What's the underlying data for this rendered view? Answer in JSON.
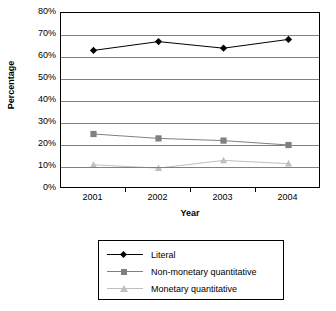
{
  "chart_data": {
    "type": "line",
    "title": "",
    "xlabel": "Year",
    "ylabel": "Percentage",
    "categories": [
      "2001",
      "2002",
      "2003",
      "2004"
    ],
    "x": [
      2001,
      2002,
      2003,
      2004
    ],
    "ylim": [
      0,
      80
    ],
    "ytick_labels": [
      "0%",
      "10%",
      "20%",
      "30%",
      "40%",
      "50%",
      "60%",
      "70%",
      "80%"
    ],
    "ytick_values": [
      0,
      10,
      20,
      30,
      40,
      50,
      60,
      70,
      80
    ],
    "grid": true,
    "legend_position": "bottom",
    "series": [
      {
        "name": "Literal",
        "values": [
          63,
          67,
          64,
          68
        ],
        "color": "#000000",
        "marker": "diamond"
      },
      {
        "name": "Non-monetary quantitative",
        "values": [
          25,
          23,
          22,
          20
        ],
        "color": "#808080",
        "marker": "square"
      },
      {
        "name": "Monetary quantitative",
        "values": [
          11,
          9.5,
          13,
          11.5
        ],
        "color": "#bfbfbf",
        "marker": "triangle"
      }
    ]
  },
  "axes": {
    "y_title": "Percentage",
    "x_title": "Year"
  },
  "legend": {
    "items": [
      {
        "label": "Literal"
      },
      {
        "label": "Non-monetary quantitative"
      },
      {
        "label": "Monetary quantitative"
      }
    ]
  }
}
